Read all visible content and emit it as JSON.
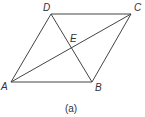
{
  "figure": {
    "caption": "(a)",
    "shape": "parallelogram",
    "vertices": [
      {
        "id": "A",
        "label": "A",
        "x": 11,
        "y": 82
      },
      {
        "id": "B",
        "label": "B",
        "x": 92,
        "y": 82
      },
      {
        "id": "C",
        "label": "C",
        "x": 131,
        "y": 14
      },
      {
        "id": "D",
        "label": "D",
        "x": 51,
        "y": 14
      }
    ],
    "intersection": {
      "id": "E",
      "label": "E",
      "x": 72,
      "y": 48
    },
    "edges": [
      "AB",
      "BC",
      "CD",
      "DA"
    ],
    "diagonals": [
      "AC",
      "DB"
    ],
    "colors": {
      "line": "#444444",
      "text": "#333333",
      "background": "#ffffff"
    }
  }
}
